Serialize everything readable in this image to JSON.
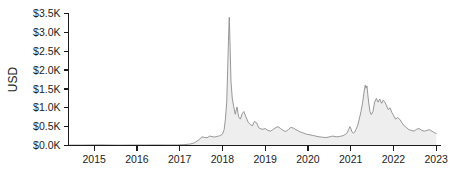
{
  "chart_data": {
    "type": "area",
    "title": "",
    "subtitle": "",
    "xlabel": "",
    "ylabel": "USD",
    "xlim": [
      2014.4,
      2023.1
    ],
    "ylim": [
      0,
      3500
    ],
    "grid": false,
    "legend": "none",
    "y_ticks": [
      0,
      500,
      1000,
      1500,
      2000,
      2500,
      3000,
      3500
    ],
    "y_tick_labels": [
      "$0.0K",
      "$0.5K",
      "$1.0K",
      "$1.5K",
      "$2.0K",
      "$2.5K",
      "$3.0K",
      "$3.5K"
    ],
    "x_ticks": [
      2015,
      2016,
      2017,
      2018,
      2019,
      2020,
      2021,
      2022,
      2023
    ],
    "x_tick_labels": [
      "2015",
      "2016",
      "2017",
      "2018",
      "2019",
      "2020",
      "2021",
      "2022",
      "2023"
    ],
    "series": [
      {
        "name": "USD price",
        "line_color": "#8c8c8c",
        "fill_color": "#ebebeb",
        "x": [
          2014.4,
          2014.55,
          2014.7,
          2014.85,
          2015.0,
          2015.15,
          2015.3,
          2015.45,
          2015.6,
          2015.75,
          2015.9,
          2016.05,
          2016.2,
          2016.35,
          2016.5,
          2016.65,
          2016.8,
          2016.95,
          2017.1,
          2017.25,
          2017.35,
          2017.45,
          2017.52,
          2017.58,
          2017.64,
          2017.7,
          2017.76,
          2017.82,
          2017.88,
          2017.94,
          2018.0,
          2018.04,
          2018.07,
          2018.1,
          2018.12,
          2018.14,
          2018.16,
          2018.18,
          2018.2,
          2018.23,
          2018.26,
          2018.3,
          2018.34,
          2018.38,
          2018.42,
          2018.46,
          2018.5,
          2018.55,
          2018.6,
          2018.65,
          2018.7,
          2018.75,
          2018.8,
          2018.85,
          2018.9,
          2018.95,
          2019.0,
          2019.06,
          2019.12,
          2019.18,
          2019.24,
          2019.3,
          2019.36,
          2019.42,
          2019.48,
          2019.54,
          2019.6,
          2019.66,
          2019.72,
          2019.78,
          2019.84,
          2019.9,
          2019.96,
          2020.02,
          2020.1,
          2020.18,
          2020.26,
          2020.34,
          2020.42,
          2020.5,
          2020.58,
          2020.66,
          2020.74,
          2020.82,
          2020.88,
          2020.92,
          2020.95,
          2020.98,
          2021.0,
          2021.03,
          2021.06,
          2021.09,
          2021.12,
          2021.16,
          2021.2,
          2021.24,
          2021.28,
          2021.31,
          2021.34,
          2021.36,
          2021.38,
          2021.4,
          2021.42,
          2021.45,
          2021.48,
          2021.52,
          2021.56,
          2021.6,
          2021.64,
          2021.68,
          2021.72,
          2021.76,
          2021.8,
          2021.84,
          2021.88,
          2021.92,
          2021.96,
          2022.0,
          2022.05,
          2022.1,
          2022.15,
          2022.2,
          2022.25,
          2022.3,
          2022.36,
          2022.42,
          2022.48,
          2022.54,
          2022.6,
          2022.66,
          2022.72,
          2022.78,
          2022.84,
          2022.9,
          2022.96,
          2023.0
        ],
        "y": [
          10,
          12,
          11,
          14,
          16,
          18,
          14,
          12,
          10,
          12,
          13,
          14,
          13,
          15,
          16,
          14,
          13,
          15,
          22,
          40,
          75,
          150,
          230,
          215,
          205,
          250,
          235,
          225,
          240,
          260,
          300,
          420,
          700,
          1150,
          1900,
          2750,
          3400,
          2600,
          1700,
          1250,
          1050,
          830,
          1020,
          760,
          700,
          840,
          900,
          760,
          620,
          560,
          520,
          640,
          600,
          470,
          440,
          430,
          450,
          400,
          380,
          420,
          470,
          500,
          450,
          400,
          370,
          420,
          480,
          460,
          420,
          380,
          350,
          330,
          300,
          290,
          270,
          250,
          230,
          220,
          210,
          230,
          250,
          230,
          240,
          260,
          300,
          340,
          420,
          500,
          460,
          360,
          330,
          350,
          420,
          520,
          700,
          900,
          1150,
          1400,
          1600,
          1520,
          1580,
          1350,
          1150,
          900,
          820,
          900,
          1150,
          1250,
          1150,
          1230,
          1120,
          1200,
          1150,
          1050,
          950,
          1000,
          880,
          800,
          700,
          740,
          690,
          600,
          520,
          480,
          420,
          400,
          380,
          430,
          450,
          400,
          380,
          400,
          420,
          380,
          340,
          320
        ]
      }
    ]
  }
}
